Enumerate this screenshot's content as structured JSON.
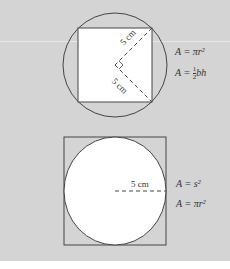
{
  "figure_top": {
    "label_upper": "5 cm",
    "label_lower": "5 cm",
    "formula_1": "A = πr²",
    "formula_2_prefix": "A = ",
    "formula_2_num": "1",
    "formula_2_den": "2",
    "formula_2_suffix": "bh"
  },
  "figure_bottom": {
    "label_radius": "5 cm",
    "formula_1": "A = s²",
    "formula_2": "A = πr²"
  },
  "colors": {
    "background": "#d4d4d4",
    "shape_fill": "#ffffff",
    "stroke": "#444444"
  }
}
